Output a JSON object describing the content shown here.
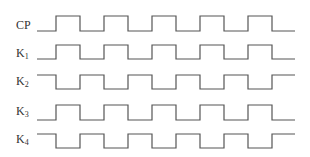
{
  "diagram": {
    "type": "timing-diagram",
    "colors": {
      "line": "#555555",
      "label": "#333333",
      "background": "#ffffff"
    },
    "x_start": 37,
    "x_end": 295,
    "edges": [
      56,
      80,
      104,
      128,
      152,
      176,
      200,
      224,
      248,
      272
    ],
    "signals": [
      {
        "name": "CP",
        "base": "CP",
        "sub": "",
        "initial": "low",
        "y_high": 16,
        "y_low": 31,
        "label_y": 19
      },
      {
        "name": "K1",
        "base": "K",
        "sub": "1",
        "initial": "low",
        "y_high": 45,
        "y_low": 59,
        "label_y": 47
      },
      {
        "name": "K2",
        "base": "K",
        "sub": "2",
        "initial": "high",
        "y_high": 75,
        "y_low": 89,
        "label_y": 75
      },
      {
        "name": "K3",
        "base": "K",
        "sub": "3",
        "initial": "low",
        "y_high": 105,
        "y_low": 120,
        "label_y": 105
      },
      {
        "name": "K4",
        "base": "K",
        "sub": "4",
        "initial": "high",
        "y_high": 134,
        "y_low": 148,
        "label_y": 133
      }
    ]
  }
}
